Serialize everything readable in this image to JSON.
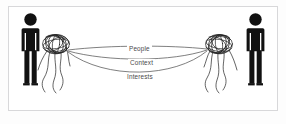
{
  "diagram": {
    "frame": {
      "border_color": "#d8d8da",
      "background_color": "#ffffff"
    },
    "figures": [
      {
        "id": "left-person",
        "name": "person-silhouette-left",
        "color": "#111111",
        "side": "left"
      },
      {
        "id": "right-person",
        "name": "person-silhouette-right",
        "color": "#111111",
        "side": "right"
      }
    ],
    "tangles": [
      {
        "id": "left-tangle",
        "name": "tangled-threads-left",
        "color": "#2b2b2b"
      },
      {
        "id": "right-tangle",
        "name": "tangled-threads-right",
        "color": "#2b2b2b"
      }
    ],
    "connections": [
      {
        "id": "people",
        "label": "People",
        "color": "#555555"
      },
      {
        "id": "context",
        "label": "Context",
        "color": "#555555"
      },
      {
        "id": "interests",
        "label": "Interests",
        "color": "#555555"
      }
    ]
  }
}
